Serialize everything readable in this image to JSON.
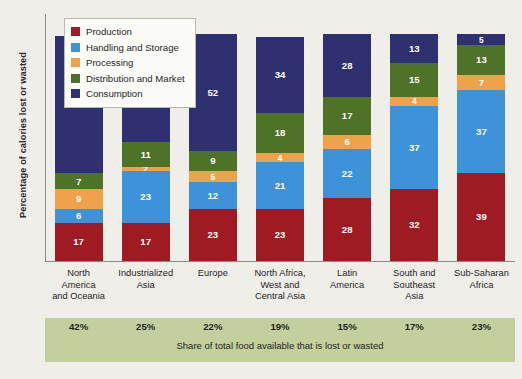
{
  "chart_data": {
    "type": "bar",
    "title": "",
    "ylabel": "Percentage of calories lost or wasted",
    "xlabel": "",
    "ylim": [
      0,
      110
    ],
    "grid": false,
    "stacked": true,
    "legend_position": "top-left",
    "categories": [
      "North America and Oceania",
      "Industrialized Asia",
      "Europe",
      "North Africa, West and Central Asia",
      "Latin America",
      "South and Southeast Asia",
      "Sub-Saharan Africa"
    ],
    "series": [
      {
        "name": "Production",
        "color": "#9e1b23",
        "values": [
          17,
          17,
          23,
          23,
          28,
          32,
          39
        ]
      },
      {
        "name": "Handling and Storage",
        "color": "#3d92d8",
        "values": [
          6,
          23,
          12,
          21,
          22,
          37,
          37
        ]
      },
      {
        "name": "Processing",
        "color": "#f0a24b",
        "values": [
          9,
          2,
          5,
          4,
          6,
          4,
          7
        ]
      },
      {
        "name": "Distribution and Market",
        "color": "#4e7328",
        "values": [
          7,
          11,
          9,
          18,
          17,
          15,
          13
        ]
      },
      {
        "name": "Consumption",
        "color": "#2e3070",
        "values": [
          61,
          46,
          52,
          34,
          28,
          13,
          5
        ]
      }
    ],
    "annotations": {
      "share_values": [
        "42%",
        "25%",
        "22%",
        "19%",
        "15%",
        "17%",
        "23%"
      ],
      "share_note": "Share of total food available that is lost or wasted"
    }
  },
  "legend": {
    "items": [
      {
        "label": "Production"
      },
      {
        "label": "Handling and Storage"
      },
      {
        "label": "Processing"
      },
      {
        "label": "Distribution and Market"
      },
      {
        "label": "Consumption"
      }
    ]
  },
  "category_lines": [
    [
      "North",
      "America",
      "and Oceania"
    ],
    [
      "Industrialized",
      "Asia"
    ],
    [
      "Europe"
    ],
    [
      "North Africa,",
      "West and",
      "Central Asia"
    ],
    [
      "Latin",
      "America"
    ],
    [
      "South and",
      "Southeast",
      "Asia"
    ],
    [
      "Sub-Saharan",
      "Africa"
    ]
  ]
}
